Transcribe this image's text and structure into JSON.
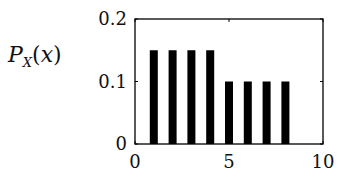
{
  "chart_data": {
    "type": "bar",
    "title": "",
    "xlabel": "",
    "ylabel": "P_X(x)",
    "x": [
      1,
      2,
      3,
      4,
      5,
      6,
      7,
      8
    ],
    "values": [
      0.15,
      0.15,
      0.15,
      0.15,
      0.1,
      0.1,
      0.1,
      0.1
    ],
    "xlim": [
      0,
      10
    ],
    "ylim": [
      0,
      0.2
    ],
    "xticks": [
      0,
      5,
      10
    ],
    "xtick_labels": [
      "0",
      "5",
      "10"
    ],
    "yticks": [
      0,
      0.1,
      0.2
    ],
    "ytick_labels": [
      "0",
      "0.1",
      "0.2"
    ],
    "grid": false,
    "legend": null,
    "bar_color": "#000000"
  },
  "labels": {
    "ylabel_main": "P",
    "ylabel_sub": "X",
    "ylabel_open": "(",
    "ylabel_var": "x",
    "ylabel_close": ")"
  }
}
